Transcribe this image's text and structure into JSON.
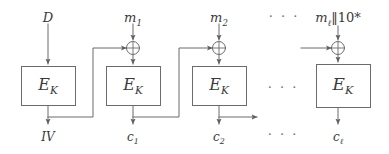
{
  "figure": {
    "type": "block-cipher-mode-diagram",
    "width": 389,
    "height": 154,
    "background_color": "#ffffff",
    "line_color": "#6b6b6b",
    "text_color": "#3a3a3a"
  },
  "top_labels": [
    {
      "id": "input-d",
      "text": "D",
      "x": 48,
      "y": 12
    },
    {
      "id": "input-m1",
      "text": "m",
      "sub": "1",
      "x": 133,
      "y": 12
    },
    {
      "id": "input-m2",
      "text": "m",
      "sub": "2",
      "x": 219,
      "y": 12
    },
    {
      "id": "input-ml",
      "text": "m",
      "sub": "ℓ",
      "suffix": "‖10*",
      "x": 338,
      "y": 12
    }
  ],
  "top_label_ml_parts": {
    "base": "m",
    "subscript": "ℓ",
    "concat": "‖",
    "pad": "10*"
  },
  "blocks": [
    {
      "id": "block-1",
      "label": "E",
      "sub": "K",
      "x": 21,
      "y": 66,
      "w": 55,
      "h": 40
    },
    {
      "id": "block-2",
      "label": "E",
      "sub": "K",
      "x": 106,
      "y": 66,
      "w": 55,
      "h": 40
    },
    {
      "id": "block-3",
      "label": "E",
      "sub": "K",
      "x": 192,
      "y": 66,
      "w": 55,
      "h": 40
    },
    {
      "id": "block-4",
      "label": "E",
      "sub": "K",
      "x": 316,
      "y": 64,
      "w": 55,
      "h": 44
    }
  ],
  "xor_gates": [
    {
      "id": "xor-1",
      "cx": 133,
      "cy": 48,
      "r": 7,
      "symbol": "⊕"
    },
    {
      "id": "xor-2",
      "cx": 219,
      "cy": 48,
      "r": 7,
      "symbol": "⊕"
    },
    {
      "id": "xor-3",
      "cx": 338,
      "cy": 48,
      "r": 7,
      "symbol": "⊕"
    }
  ],
  "bottom_labels": [
    {
      "id": "output-iv",
      "text": "IV",
      "x": 48,
      "y": 133
    },
    {
      "id": "output-c1",
      "text": "c",
      "sub": "1",
      "x": 133,
      "y": 133
    },
    {
      "id": "output-c2",
      "text": "c",
      "sub": "2",
      "x": 219,
      "y": 133
    },
    {
      "id": "output-cl",
      "text": "c",
      "sub": "ℓ",
      "x": 338,
      "y": 133
    }
  ],
  "ellipses": [
    {
      "id": "ellipsis-top",
      "text": "· · ·",
      "x": 284,
      "y": 16
    },
    {
      "id": "ellipsis-middle",
      "text": "· · ·",
      "x": 283,
      "y": 87
    },
    {
      "id": "ellipsis-bottom",
      "text": "· · ·",
      "x": 283,
      "y": 131
    }
  ]
}
